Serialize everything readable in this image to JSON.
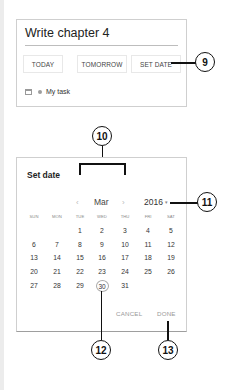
{
  "task_card": {
    "title": "Write chapter 4",
    "quick_dates": [
      {
        "label": "TODAY"
      },
      {
        "label": "TOMORROW"
      },
      {
        "label": "SET DATE"
      }
    ],
    "list_icon": "calendar-icon",
    "list_name": "My task"
  },
  "dialog": {
    "title": "Set date",
    "prev_icon": "‹",
    "next_icon": "›",
    "month": "Mar",
    "year": "2016",
    "year_dropdown_icon": "▾",
    "weekdays": [
      "SUN",
      "MON",
      "TUE",
      "WED",
      "THU",
      "FRI",
      "SAT"
    ],
    "weeks": [
      [
        "",
        "",
        "1",
        "2",
        "3",
        "4",
        "5"
      ],
      [
        "6",
        "7",
        "8",
        "9",
        "10",
        "11",
        "12"
      ],
      [
        "13",
        "14",
        "15",
        "16",
        "17",
        "18",
        "19"
      ],
      [
        "20",
        "21",
        "22",
        "23",
        "24",
        "25",
        "26"
      ],
      [
        "27",
        "28",
        "29",
        "30",
        "31",
        "",
        ""
      ]
    ],
    "selected_day": "30",
    "cancel_label": "CANCEL",
    "done_label": "DONE"
  },
  "callouts": {
    "c9": "9",
    "c10": "10",
    "c11": "11",
    "c12": "12",
    "c13": "13"
  }
}
